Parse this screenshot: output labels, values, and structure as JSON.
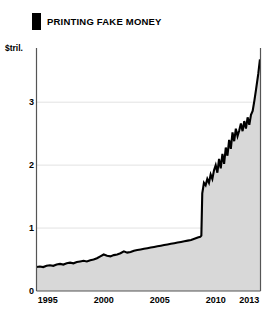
{
  "header": {
    "marker_icon": "black-square-marker",
    "title": "PRINTING FAKE MONEY"
  },
  "axis": {
    "unit_label": "$tril."
  },
  "chart_data": {
    "type": "area",
    "title": "PRINTING FAKE MONEY",
    "subtitle": "",
    "xlabel": "",
    "ylabel": "$tril.",
    "unit": "$tril.",
    "grid": true,
    "legend": "none",
    "line_color": "#000000",
    "fill_color": "#d8d8d8",
    "background_color": "#ffffff",
    "xlim": [
      1994.0,
      2014.0
    ],
    "ylim": [
      0,
      3.75
    ],
    "xticks": [
      1995,
      2000,
      2005,
      2010,
      2013
    ],
    "xtick_labels": [
      "1995",
      "2000",
      "2005",
      "2010",
      "2013"
    ],
    "yticks": [
      0,
      1,
      2,
      3
    ],
    "ytick_labels": [
      "0",
      "1",
      "2",
      "3"
    ],
    "x": [
      1994.0,
      1994.3,
      1994.6,
      1994.9,
      1995.2,
      1995.5,
      1995.8,
      1996.1,
      1996.4,
      1996.7,
      1997.0,
      1997.3,
      1997.6,
      1997.9,
      1998.2,
      1998.5,
      1998.8,
      1999.1,
      1999.4,
      1999.7,
      2000.0,
      2000.3,
      2000.6,
      2000.9,
      2001.2,
      2001.5,
      2001.8,
      2002.1,
      2002.4,
      2002.7,
      2003.0,
      2003.3,
      2003.6,
      2003.9,
      2004.2,
      2004.5,
      2004.8,
      2005.1,
      2005.4,
      2005.7,
      2006.0,
      2006.3,
      2006.6,
      2006.9,
      2007.2,
      2007.5,
      2007.8,
      2008.1,
      2008.4,
      2008.62,
      2008.72,
      2008.8,
      2008.95,
      2009.1,
      2009.25,
      2009.4,
      2009.55,
      2009.7,
      2009.85,
      2010.0,
      2010.15,
      2010.3,
      2010.45,
      2010.6,
      2010.75,
      2010.9,
      2011.05,
      2011.2,
      2011.35,
      2011.5,
      2011.65,
      2011.8,
      2011.95,
      2012.1,
      2012.25,
      2012.4,
      2012.55,
      2012.7,
      2012.85,
      2013.0,
      2013.15,
      2013.3,
      2013.45,
      2013.6,
      2013.8,
      2013.95
    ],
    "values": [
      0.38,
      0.39,
      0.38,
      0.4,
      0.41,
      0.4,
      0.42,
      0.43,
      0.42,
      0.44,
      0.45,
      0.44,
      0.46,
      0.47,
      0.48,
      0.47,
      0.49,
      0.5,
      0.52,
      0.55,
      0.58,
      0.56,
      0.55,
      0.57,
      0.58,
      0.6,
      0.63,
      0.61,
      0.62,
      0.64,
      0.65,
      0.66,
      0.67,
      0.68,
      0.69,
      0.7,
      0.71,
      0.72,
      0.73,
      0.74,
      0.75,
      0.76,
      0.77,
      0.78,
      0.79,
      0.8,
      0.81,
      0.83,
      0.85,
      0.86,
      0.88,
      1.55,
      1.72,
      1.68,
      1.78,
      1.72,
      1.85,
      1.78,
      1.92,
      2.0,
      1.88,
      2.1,
      1.95,
      2.18,
      2.02,
      2.28,
      2.15,
      2.4,
      2.26,
      2.52,
      2.38,
      2.58,
      2.46,
      2.55,
      2.66,
      2.54,
      2.7,
      2.58,
      2.76,
      2.64,
      2.8,
      2.86,
      3.02,
      3.2,
      3.45,
      3.68
    ]
  }
}
